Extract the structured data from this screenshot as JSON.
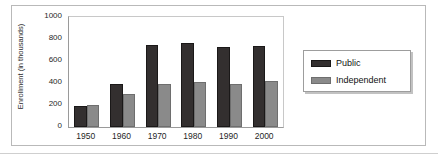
{
  "chart_data": {
    "type": "bar",
    "title": "",
    "xlabel": "",
    "ylabel": "Enrollment (in thousands)",
    "categories": [
      "1950",
      "1960",
      "1970",
      "1980",
      "1990",
      "2000"
    ],
    "series": [
      {
        "name": "Public",
        "color": "#332f2f",
        "values": [
          190,
          390,
          750,
          765,
          725,
          740
        ]
      },
      {
        "name": "Independent",
        "color": "#8a8a8a",
        "values": [
          200,
          300,
          395,
          410,
          390,
          415
        ]
      }
    ],
    "ylim": [
      0,
      1000
    ],
    "yticks": [
      0,
      200,
      400,
      600,
      800,
      1000
    ],
    "ytick_labels": [
      "0",
      "200",
      "400",
      "600",
      "800",
      "1000"
    ],
    "grid": false,
    "legend_position": "right"
  },
  "legend": {
    "items": [
      {
        "label": "Public"
      },
      {
        "label": "Independent"
      }
    ]
  }
}
